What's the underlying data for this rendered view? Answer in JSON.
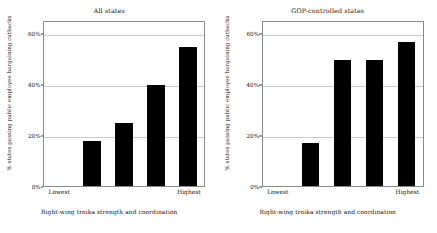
{
  "figure": {
    "background": "#ffffff",
    "bar_color": "#000000",
    "grid_color": "#c9c9c9",
    "axis_color": "#8a8a8a"
  },
  "chart_data": [
    {
      "type": "bar",
      "title": "All states",
      "xlabel": "Right-wing troika strength and coordination",
      "ylabel": "% states passing public employee bargaining cutbacks",
      "categories": [
        "Lowest",
        "",
        "",
        "",
        "Highest"
      ],
      "tick_labels": [
        "Lowest",
        "Highest"
      ],
      "values": [
        0,
        18,
        25,
        40,
        55
      ],
      "ylim": [
        0,
        65
      ],
      "yticks": [
        0,
        20,
        40,
        60
      ],
      "ytick_labels": [
        "0%",
        "20%",
        "40%",
        "60%"
      ],
      "grid": true,
      "legend": "none"
    },
    {
      "type": "bar",
      "title": "GOP-controlled states",
      "xlabel": "Right-wing troika strength and coordination",
      "ylabel": "% states passing public employee bargaining cutbacks",
      "categories": [
        "Lowest",
        "",
        "",
        "",
        "Highest"
      ],
      "tick_labels": [
        "Lowest",
        "Highest"
      ],
      "values": [
        0,
        17,
        50,
        50,
        57
      ],
      "ylim": [
        0,
        65
      ],
      "yticks": [
        0,
        20,
        40,
        60
      ],
      "ytick_labels": [
        "0%",
        "20%",
        "40%",
        "60%"
      ],
      "grid": true,
      "legend": "none"
    }
  ]
}
